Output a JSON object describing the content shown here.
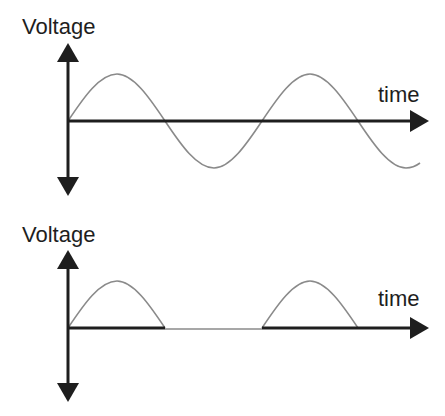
{
  "colors": {
    "axis": "#1e1e1e",
    "curve": "#8a8a8a",
    "background": "#ffffff"
  },
  "top_panel": {
    "y_label": "Voltage",
    "x_label": "time",
    "description": "AC sine wave voltage over time"
  },
  "bottom_panel": {
    "y_label": "Voltage",
    "x_label": "time",
    "description": "Half-wave rectified voltage over time"
  }
}
